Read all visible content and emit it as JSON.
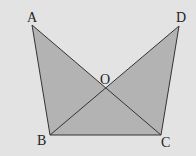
{
  "diagram": {
    "type": "geometry-figure",
    "background": "#e3e3e3",
    "fill_color": "#b3b3b3",
    "stroke_color": "#333333",
    "points": {
      "A": {
        "label": "A",
        "x": 32,
        "y": 25
      },
      "D": {
        "label": "D",
        "x": 179,
        "y": 26
      },
      "O": {
        "label": "O",
        "x": 105,
        "y": 87
      },
      "B": {
        "label": "B",
        "x": 50,
        "y": 135
      },
      "C": {
        "label": "C",
        "x": 161,
        "y": 135
      }
    },
    "triangles": [
      [
        "A",
        "B",
        "C"
      ],
      [
        "D",
        "B",
        "C"
      ]
    ],
    "segments": [
      [
        "A",
        "B"
      ],
      [
        "A",
        "C"
      ],
      [
        "D",
        "B"
      ],
      [
        "D",
        "C"
      ],
      [
        "B",
        "C"
      ]
    ]
  }
}
